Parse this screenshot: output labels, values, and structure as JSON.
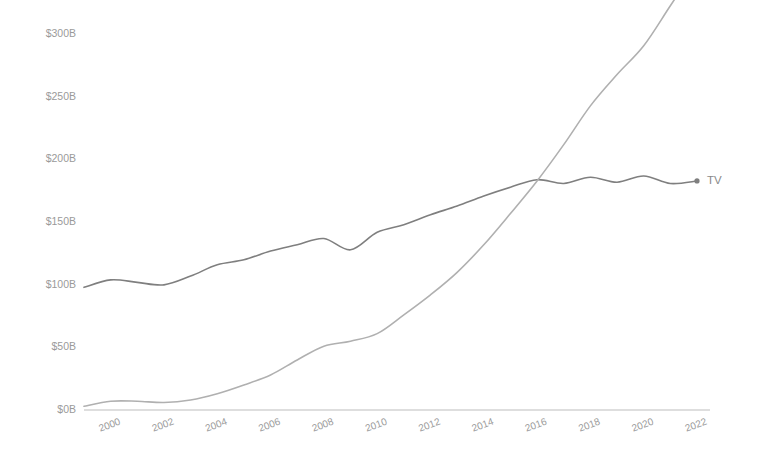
{
  "chart_data": {
    "type": "line",
    "title": "",
    "subtitle": "",
    "xlabel": "",
    "ylabel": "",
    "xlim": [
      1999,
      2022
    ],
    "ylim": [
      0,
      310
    ],
    "grid": false,
    "legend_position": "line-end-labels",
    "x": [
      1999,
      2000,
      2001,
      2002,
      2003,
      2004,
      2005,
      2006,
      2007,
      2008,
      2009,
      2010,
      2011,
      2012,
      2013,
      2014,
      2015,
      2016,
      2017,
      2018,
      2019,
      2020,
      2021,
      2022
    ],
    "x_tick_labels": [
      "2000",
      "2002",
      "2004",
      "2006",
      "2008",
      "2010",
      "2012",
      "2014",
      "2016",
      "2018",
      "2020",
      "2022"
    ],
    "x_tick_values": [
      2000,
      2002,
      2004,
      2006,
      2008,
      2010,
      2012,
      2014,
      2016,
      2018,
      2020,
      2022
    ],
    "y_tick_labels": [
      "$0B",
      "$50B",
      "$100B",
      "$150B",
      "$200B",
      "$250B",
      "$300B"
    ],
    "y_tick_values": [
      0,
      50,
      100,
      150,
      200,
      250,
      300
    ],
    "y_unit": "B",
    "y_prefix": "$",
    "series": [
      {
        "name": "TV",
        "label": "TV",
        "color": "#7f7f7f",
        "end_label_value": 183,
        "values": [
          98,
          104,
          102,
          100,
          107,
          116,
          120,
          127,
          132,
          137,
          128,
          142,
          148,
          156,
          163,
          171,
          178,
          184,
          181,
          186,
          182,
          187,
          181,
          183
        ]
      },
      {
        "name": "Digital",
        "label": "Digital",
        "color": "#b0b0b0",
        "end_label_value": 355,
        "values": [
          3,
          7,
          7,
          6,
          8,
          13,
          20,
          28,
          40,
          51,
          55,
          61,
          76,
          92,
          110,
          132,
          157,
          183,
          212,
          243,
          268,
          291,
          323,
          355
        ]
      }
    ],
    "annotations": {
      "crossover_year": 2016,
      "crossover_value": 184
    }
  },
  "axes": {
    "x_axis_name": "year-axis",
    "y_axis_name": "spend-axis"
  }
}
